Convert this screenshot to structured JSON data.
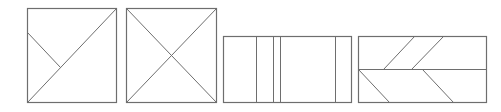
{
  "figure": {
    "stroke_color": "#6e6e6e",
    "background": "#ffffff",
    "shapes": [
      {
        "id": "shape-1",
        "type": "square",
        "description": "square with one full diagonal (bottom-left to top-right) and a short segment from left edge meeting the diagonal",
        "rect": {
          "x": 27,
          "y": 8,
          "w": 89,
          "h": 94
        },
        "lines": [
          {
            "x1": 27,
            "y1": 102,
            "x2": 116,
            "y2": 8
          },
          {
            "x1": 27,
            "y1": 32,
            "x2": 60,
            "y2": 67
          }
        ]
      },
      {
        "id": "shape-2",
        "type": "square",
        "description": "square with both diagonals forming an X",
        "rect": {
          "x": 126,
          "y": 8,
          "w": 90,
          "h": 94
        },
        "lines": [
          {
            "x1": 126,
            "y1": 8,
            "x2": 216,
            "y2": 102
          },
          {
            "x1": 216,
            "y1": 8,
            "x2": 126,
            "y2": 102
          }
        ]
      },
      {
        "id": "shape-3",
        "type": "rectangle",
        "description": "rectangle divided by four vertical lines",
        "rect": {
          "x": 223,
          "y": 36,
          "w": 128,
          "h": 66
        },
        "lines": [
          {
            "x1": 256,
            "y1": 36,
            "x2": 256,
            "y2": 102
          },
          {
            "x1": 273,
            "y1": 36,
            "x2": 273,
            "y2": 102
          },
          {
            "x1": 280,
            "y1": 36,
            "x2": 280,
            "y2": 102
          },
          {
            "x1": 335,
            "y1": 36,
            "x2": 335,
            "y2": 102
          }
        ]
      },
      {
        "id": "shape-4",
        "type": "rectangle",
        "description": "rectangle split horizontally at mid-height with two parallel slanted lines in each half",
        "rect": {
          "x": 358,
          "y": 36,
          "w": 128,
          "h": 66
        },
        "lines": [
          {
            "x1": 358,
            "y1": 69,
            "x2": 486,
            "y2": 69
          },
          {
            "x1": 383,
            "y1": 69,
            "x2": 414,
            "y2": 36
          },
          {
            "x1": 411,
            "y1": 69,
            "x2": 443,
            "y2": 36
          },
          {
            "x1": 358,
            "y1": 69,
            "x2": 389,
            "y2": 102
          },
          {
            "x1": 422,
            "y1": 69,
            "x2": 453,
            "y2": 102
          }
        ]
      }
    ]
  }
}
